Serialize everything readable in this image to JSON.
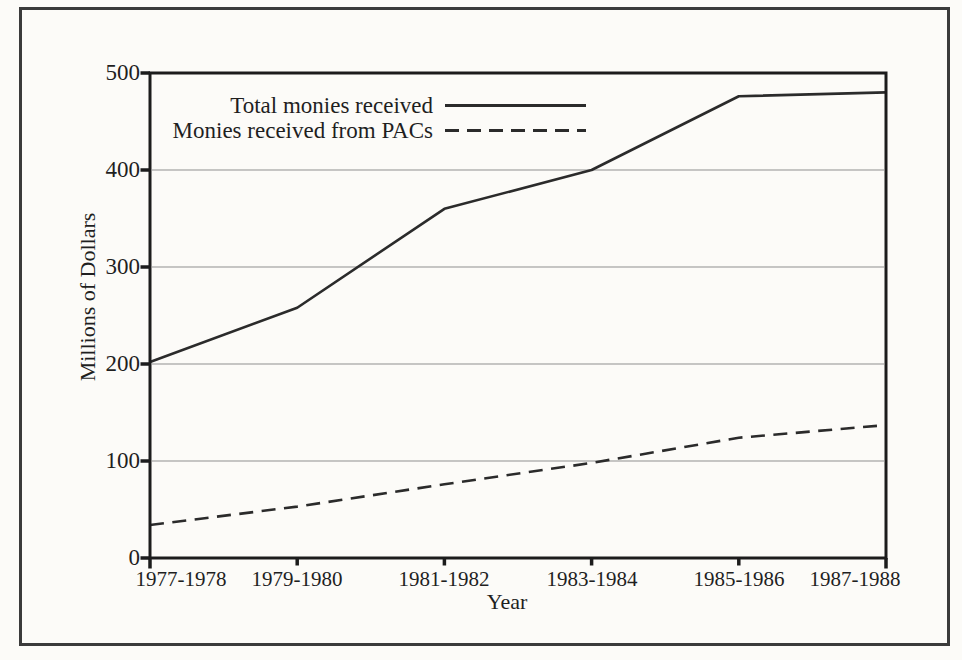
{
  "page": {
    "background": "#fcfbf8",
    "border_color": "#3b3b3b"
  },
  "chart_data": {
    "type": "line",
    "title": "",
    "xlabel": "Year",
    "ylabel": "Millions of Dollars",
    "categories": [
      "1977-1978",
      "1979-1980",
      "1981-1982",
      "1983-1984",
      "1985-1986",
      "1987-1988"
    ],
    "series": [
      {
        "name": "Total monies received",
        "style": "solid",
        "values": [
          202,
          258,
          360,
          400,
          476,
          480
        ]
      },
      {
        "name": "Monies received from PACs",
        "style": "dashed",
        "values": [
          34,
          53,
          76,
          98,
          124,
          137
        ]
      }
    ],
    "ylim": [
      0,
      500
    ],
    "y_ticks": [
      0,
      100,
      200,
      300,
      400,
      500
    ],
    "grid": "horizontal gridlines at 100, 200, 300, 400",
    "legend_position": "top-left inside plot",
    "line_color": "#2b2b2b",
    "frame_color": "#1c1c1c",
    "gridline_color": "#8f8f8f"
  }
}
